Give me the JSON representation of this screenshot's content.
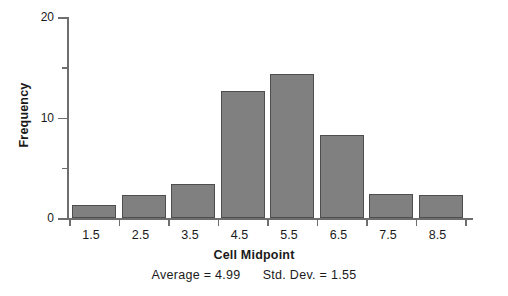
{
  "chart_data": {
    "type": "bar",
    "title": "",
    "subtitle": "",
    "xlabel": "Cell Midpoint",
    "ylabel": "Frequency",
    "categories": [
      "1.5",
      "2.5",
      "3.5",
      "4.5",
      "5.5",
      "6.5",
      "7.5",
      "8.5"
    ],
    "values": [
      1.3,
      2.3,
      3.4,
      12.6,
      14.3,
      8.3,
      2.4,
      2.3
    ],
    "ylim": [
      0,
      20
    ],
    "xlim": [
      1,
      9
    ],
    "y_major_ticks": [
      0,
      10,
      20
    ],
    "y_minor_ticks": [
      5,
      15
    ],
    "y_tick_labels": [
      "0",
      "10",
      "20"
    ],
    "grid": false,
    "legend": false,
    "bar_color": "#808080",
    "bar_edge_color": "#4e4e4e",
    "axis_color": "#6e6e6e"
  },
  "annotations": {
    "average_label": "Average  =  4.99",
    "stddev_label": "Std. Dev.  =  1.55",
    "average_value": 4.99,
    "stddev_value": 1.55
  }
}
